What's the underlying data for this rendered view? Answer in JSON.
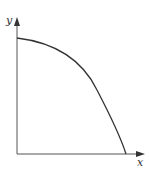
{
  "diagram": {
    "type": "concave curve between axes (frontier)",
    "axes": {
      "x_label": "x",
      "y_label": "y"
    },
    "colors": {
      "axis": "#555555",
      "curve": "#333333",
      "label": "#333333",
      "background": "#ffffff"
    },
    "curve": {
      "description": "Concave-to-origin curve from y-intercept down to x-intercept",
      "path": "M17,38 C50,42 80,55 97,90 C110,115 120,135 126,154"
    }
  }
}
